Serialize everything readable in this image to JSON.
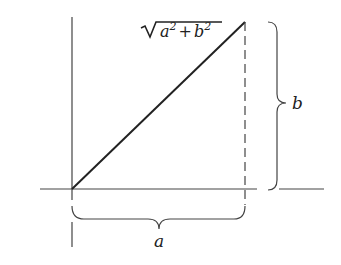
{
  "diagram": {
    "type": "right-triangle-hypotenuse",
    "labels": {
      "hypotenuse": {
        "radicand_a": "a",
        "exp": "2",
        "plus": "+",
        "radicand_b": "b",
        "exp2": "2"
      },
      "horizontal_side": "a",
      "vertical_side": "b"
    },
    "colors": {
      "stroke": "#333333",
      "background": "#ffffff"
    }
  }
}
